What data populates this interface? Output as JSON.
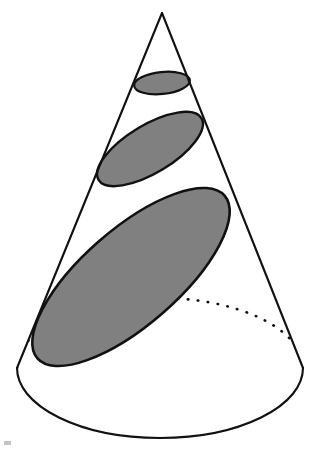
{
  "figure": {
    "caption": "",
    "background_color": "#ffffff",
    "line_color": "#111111",
    "fill_color": "#808080"
  },
  "chart_data": {
    "type": "diagram",
    "subtitle": "",
    "xlabel": "",
    "ylabel": "",
    "grid": false,
    "legend": "none",
    "canvas": {
      "width": 320,
      "height": 451
    },
    "shapes": [
      {
        "name": "cone-apex",
        "type": "point",
        "x": 162,
        "y": 13
      },
      {
        "name": "cone-base-ellipse",
        "type": "ellipse",
        "cx": 160,
        "cy": 368,
        "rx": 143,
        "ry": 70,
        "rotation_deg": 0,
        "fill": "none",
        "stroke": "#111111",
        "stroke_width": 2.1,
        "front_arc": "solid",
        "back_arc": "dotted"
      },
      {
        "name": "cone-left-slant",
        "type": "line",
        "x1": 162,
        "y1": 13,
        "x2": 17,
        "y2": 368,
        "stroke": "#111111",
        "stroke_width": 2.1
      },
      {
        "name": "cone-right-slant",
        "type": "line",
        "x1": 162,
        "y1": 13,
        "x2": 303,
        "y2": 368,
        "stroke": "#111111",
        "stroke_width": 2.1
      },
      {
        "name": "cross-section-small",
        "type": "ellipse",
        "cx": 162,
        "cy": 83,
        "rx": 28,
        "ry": 11,
        "rotation_deg": -6,
        "fill": "#808080",
        "stroke": "#111111",
        "stroke_width": 2.2
      },
      {
        "name": "cross-section-medium",
        "type": "ellipse",
        "cx": 150,
        "cy": 149,
        "rx": 60,
        "ry": 24,
        "rotation_deg": -31,
        "fill": "#808080",
        "stroke": "#111111",
        "stroke_width": 2.4
      },
      {
        "name": "cross-section-large",
        "type": "ellipse",
        "cx": 131,
        "cy": 277,
        "rx": 124,
        "ry": 48,
        "rotation_deg": -41,
        "fill": "#808080",
        "stroke": "#111111",
        "stroke_width": 2.6
      }
    ],
    "annotations": [],
    "series": [],
    "values": [],
    "categories": []
  },
  "scan_artifact": {
    "label": "scan-speck",
    "x": 4,
    "y": 441,
    "width": 7,
    "height": 4,
    "color": "#b9b9b9"
  }
}
